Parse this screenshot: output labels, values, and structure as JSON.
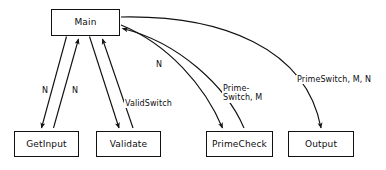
{
  "diagram": {
    "type": "structure-chart",
    "background_color": "#ffffff",
    "line_color": "#111111",
    "text_color": "#0d0d0d",
    "nodes": [
      {
        "id": "main",
        "label": "Main",
        "x": 51,
        "y": 9,
        "w": 69,
        "h": 27
      },
      {
        "id": "getinput",
        "label": "GetInput",
        "x": 14,
        "y": 131,
        "w": 65,
        "h": 26
      },
      {
        "id": "validate",
        "label": "Validate",
        "x": 96,
        "y": 131,
        "w": 65,
        "h": 26
      },
      {
        "id": "primecheck",
        "label": "PrimeCheck",
        "x": 206,
        "y": 131,
        "w": 67,
        "h": 26
      },
      {
        "id": "output",
        "label": "Output",
        "x": 288,
        "y": 131,
        "w": 66,
        "h": 26
      }
    ],
    "edges": [
      {
        "id": "main-to-getinput",
        "from": "main",
        "to": "getinput",
        "direction": "down",
        "label": ""
      },
      {
        "id": "getinput-to-main",
        "from": "getinput",
        "to": "main",
        "direction": "up",
        "label": "N"
      },
      {
        "id": "main-to-validate",
        "from": "main",
        "to": "validate",
        "direction": "down",
        "label": "N"
      },
      {
        "id": "validate-to-main",
        "from": "validate",
        "to": "main",
        "direction": "up",
        "label": "ValidSwitch"
      },
      {
        "id": "main-to-primecheck",
        "from": "main",
        "to": "primecheck",
        "direction": "down",
        "label": "N"
      },
      {
        "id": "primecheck-to-main",
        "from": "primecheck",
        "to": "main",
        "direction": "up",
        "label": "Prime-Switch, M"
      },
      {
        "id": "main-to-output",
        "from": "main",
        "to": "output",
        "direction": "down",
        "label": "PrimeSwitch, M, N"
      }
    ],
    "labels": [
      {
        "id": "label-n-getinput",
        "text": "N",
        "x": 41,
        "y": 86,
        "lines": [
          "N"
        ]
      },
      {
        "id": "label-n-validate",
        "text": "N",
        "x": 71,
        "y": 86,
        "lines": [
          "N"
        ]
      },
      {
        "id": "label-validswitch",
        "text": "ValidSwitch",
        "x": 124,
        "y": 99,
        "lines": [
          "ValidSwitch"
        ]
      },
      {
        "id": "label-n-primecheck",
        "text": "N",
        "x": 155,
        "y": 60,
        "lines": [
          "N"
        ]
      },
      {
        "id": "label-primeswitch-m",
        "text": "Prime-Switch, M",
        "x": 222,
        "y": 84,
        "lines": [
          "Prime-",
          "Switch, M"
        ]
      },
      {
        "id": "label-primeswitch-mn",
        "text": "PrimeSwitch, M, N",
        "x": 296,
        "y": 75,
        "lines": [
          "PrimeSwitch, M, N"
        ]
      }
    ]
  }
}
